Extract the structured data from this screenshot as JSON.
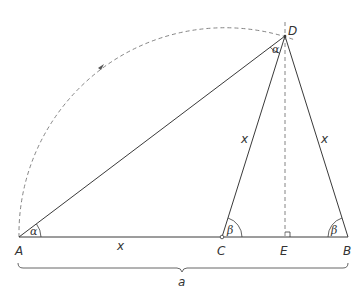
{
  "diagram": {
    "points": {
      "A": {
        "label": "A",
        "x": 19,
        "y": 237
      },
      "C": {
        "label": "C",
        "x": 222,
        "y": 237
      },
      "E": {
        "label": "E",
        "x": 285,
        "y": 237
      },
      "B": {
        "label": "B",
        "x": 348,
        "y": 237
      },
      "D": {
        "label": "D",
        "x": 285,
        "y": 36
      }
    },
    "segment_labels": {
      "AC": "x",
      "CD": "x",
      "DB": "x",
      "AB_brace": "a"
    },
    "angle_labels": {
      "at_A": "α",
      "at_D": "α",
      "at_C": "β",
      "at_B": "β"
    },
    "colors": {
      "stroke": "#3a3a3a",
      "dashed": "#6a6a6a",
      "text": "#333333"
    }
  }
}
